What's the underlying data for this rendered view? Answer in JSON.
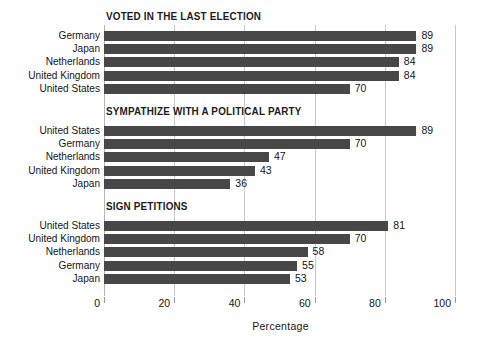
{
  "chart_data": {
    "type": "bar",
    "orientation": "horizontal",
    "title": "",
    "xlabel": "Percentage",
    "ylabel": "",
    "xlim": [
      0,
      100
    ],
    "xticks": [
      0,
      20,
      40,
      60,
      80,
      100
    ],
    "grid": true,
    "legend": "none",
    "bar_color": "#474747",
    "groups": [
      {
        "title": "VOTED IN THE LAST ELECTION",
        "categories": [
          "Germany",
          "Japan",
          "Netherlands",
          "United Kingdom",
          "United States"
        ],
        "values": [
          89,
          89,
          84,
          84,
          70
        ]
      },
      {
        "title": "SYMPATHIZE WITH A POLITICAL PARTY",
        "categories": [
          "United States",
          "Germany",
          "Netherlands",
          "United Kingdom",
          "Japan"
        ],
        "values": [
          89,
          70,
          47,
          43,
          36
        ]
      },
      {
        "title": "SIGN PETITIONS",
        "categories": [
          "United States",
          "United Kingdom",
          "Netherlands",
          "Germany",
          "Japan"
        ],
        "values": [
          81,
          70,
          58,
          55,
          53
        ]
      }
    ]
  },
  "axis": {
    "tick_labels": [
      "0",
      "20",
      "40",
      "60",
      "80",
      "100"
    ],
    "title": "Percentage"
  }
}
